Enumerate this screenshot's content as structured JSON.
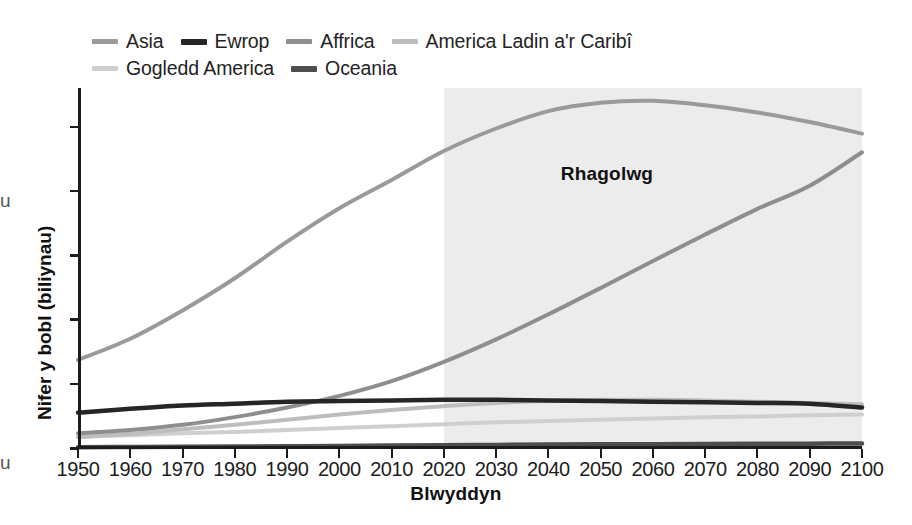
{
  "chart_data": {
    "type": "line",
    "title": "",
    "xlabel": "Blwyddyn",
    "ylabel": "Nifer y bobl (biliynau)",
    "xlim": [
      1950,
      2100
    ],
    "ylim": [
      0,
      5.6
    ],
    "yticks": [
      0,
      1,
      2,
      3,
      4,
      5
    ],
    "xticks": [
      1950,
      1960,
      1970,
      1980,
      1990,
      2000,
      2010,
      2020,
      2030,
      2040,
      2050,
      2060,
      2070,
      2080,
      2090,
      2100
    ],
    "grid": false,
    "legend_position": "top-left",
    "annotations": [
      {
        "text": "Rhagolwg",
        "x": 2055,
        "y": 4.25
      }
    ],
    "shaded_regions": [
      {
        "label": "Rhagolwg",
        "x_start": 2020,
        "x_end": 2100,
        "color": "#ececec"
      }
    ],
    "x": [
      1950,
      1960,
      1970,
      1980,
      1990,
      2000,
      2010,
      2020,
      2030,
      2040,
      2050,
      2060,
      2070,
      2080,
      2090,
      2100
    ],
    "series": [
      {
        "name": "Asia",
        "color": "#9a9a9a",
        "width": 4,
        "values": [
          1.37,
          1.7,
          2.14,
          2.64,
          3.21,
          3.73,
          4.17,
          4.62,
          4.97,
          5.24,
          5.37,
          5.4,
          5.33,
          5.22,
          5.07,
          4.89
        ]
      },
      {
        "name": "Ewrop",
        "color": "#262626",
        "width": 4.5,
        "values": [
          0.55,
          0.61,
          0.66,
          0.69,
          0.72,
          0.73,
          0.74,
          0.75,
          0.75,
          0.74,
          0.73,
          0.72,
          0.71,
          0.7,
          0.69,
          0.63
        ]
      },
      {
        "name": "Affrica",
        "color": "#8e8e8e",
        "width": 4,
        "values": [
          0.23,
          0.28,
          0.36,
          0.48,
          0.63,
          0.81,
          1.04,
          1.34,
          1.69,
          2.08,
          2.49,
          2.91,
          3.32,
          3.72,
          4.08,
          4.6
        ]
      },
      {
        "name": "America Ladin a'r Caribî",
        "color": "#bdbdbd",
        "width": 4,
        "values": [
          0.17,
          0.22,
          0.29,
          0.36,
          0.44,
          0.52,
          0.59,
          0.65,
          0.7,
          0.73,
          0.75,
          0.75,
          0.74,
          0.72,
          0.7,
          0.68
        ]
      },
      {
        "name": "Gogledd America",
        "color": "#cfcfcf",
        "width": 4,
        "values": [
          0.17,
          0.2,
          0.23,
          0.25,
          0.28,
          0.31,
          0.34,
          0.37,
          0.4,
          0.42,
          0.44,
          0.46,
          0.48,
          0.49,
          0.51,
          0.52
        ]
      },
      {
        "name": "Oceania",
        "color": "#4d4d4d",
        "width": 4.5,
        "values": [
          0.013,
          0.016,
          0.019,
          0.023,
          0.027,
          0.031,
          0.037,
          0.043,
          0.048,
          0.053,
          0.057,
          0.06,
          0.063,
          0.066,
          0.068,
          0.07
        ]
      }
    ]
  },
  "legend": {
    "rows": [
      [
        {
          "label": "Asia",
          "color": "#9a9a9a",
          "thickness": 5
        },
        {
          "label": "Ewrop",
          "color": "#262626",
          "thickness": 6
        },
        {
          "label": "Affrica",
          "color": "#8e8e8e",
          "thickness": 5
        },
        {
          "label": "America Ladin a'r Caribî",
          "color": "#bdbdbd",
          "thickness": 5
        }
      ],
      [
        {
          "label": "Gogledd America",
          "color": "#cfcfcf",
          "thickness": 5
        },
        {
          "label": "Oceania",
          "color": "#4d4d4d",
          "thickness": 6
        }
      ]
    ]
  },
  "axes": {
    "y_title": "Nifer y bobl (biliynau)",
    "x_title": "Blwyddyn",
    "y_tick_labels": [
      "0",
      "1",
      "2",
      "3",
      "4",
      "5"
    ],
    "x_tick_labels": [
      "1950",
      "1960",
      "1970",
      "1980",
      "1990",
      "2000",
      "2010",
      "2020",
      "2030",
      "2040",
      "2050",
      "2060",
      "2070",
      "2080",
      "2090",
      "2100"
    ]
  },
  "forecast": {
    "label": "Rhagolwg",
    "start_year": 2020,
    "band_color": "#ececec"
  },
  "edge_artifacts": [
    {
      "text": "u",
      "top": 190
    },
    {
      "text": "u",
      "top": 452
    }
  ]
}
